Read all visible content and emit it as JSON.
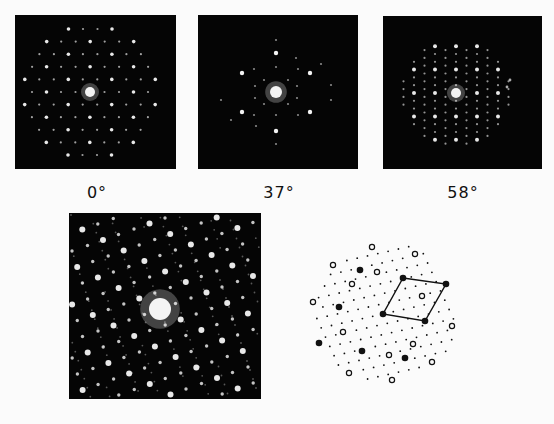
{
  "figure": {
    "top_row": [
      {
        "caption": "0°",
        "pattern": "tilt-0"
      },
      {
        "caption": "37°",
        "pattern": "tilt-37"
      },
      {
        "caption": "58°",
        "pattern": "tilt-58"
      }
    ],
    "bottom_left": {
      "pattern": "combined-diffraction"
    },
    "bottom_right": {
      "pattern": "schematic-indexing",
      "legend": {
        "filled_circle": "strong reflections",
        "open_circle": "secondary reflections",
        "small_dot": "weak reflections"
      }
    }
  },
  "colors": {
    "background": "#fbfbfb",
    "panel": "#050505",
    "spot": "#f4f4f4",
    "ink": "#111111"
  }
}
